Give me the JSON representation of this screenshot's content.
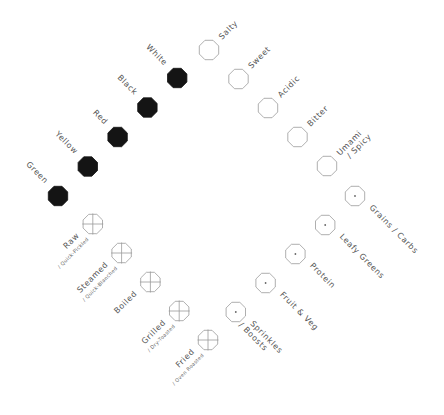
{
  "diagram": {
    "title": "",
    "groups": [
      {
        "name": "tastes",
        "marker": "hollow-octagon",
        "items": [
          {
            "label": "Salty",
            "sub": ""
          },
          {
            "label": "Sweet",
            "sub": ""
          },
          {
            "label": "Acidic",
            "sub": ""
          },
          {
            "label": "Bitter",
            "sub": ""
          },
          {
            "label": "Umami",
            "sub": "/ Spicy"
          }
        ]
      },
      {
        "name": "food-groups",
        "marker": "dotted-octagon",
        "items": [
          {
            "label": "Grains / Carbs",
            "sub": ""
          },
          {
            "label": "Leafy Greens",
            "sub": ""
          },
          {
            "label": "Protein",
            "sub": ""
          },
          {
            "label": "Fruit & Veg",
            "sub": ""
          },
          {
            "label": "Sprinkles",
            "sub": "/ Boosts"
          }
        ]
      },
      {
        "name": "cooking-methods",
        "marker": "crosshair-octagon",
        "items": [
          {
            "label": "Fried",
            "sub": "/ Oven Roasted"
          },
          {
            "label": "Grilled",
            "sub": "/ Dry-Toasted"
          },
          {
            "label": "Boiled",
            "sub": ""
          },
          {
            "label": "Steamed",
            "sub": "/ Quick-Blanched"
          },
          {
            "label": "Raw",
            "sub": "/ Quick-Pickled"
          }
        ]
      },
      {
        "name": "colors",
        "marker": "filled-octagon",
        "items": [
          {
            "label": "Green",
            "sub": ""
          },
          {
            "label": "Yellow",
            "sub": ""
          },
          {
            "label": "Red",
            "sub": ""
          },
          {
            "label": "Black",
            "sub": ""
          },
          {
            "label": "White",
            "sub": ""
          }
        ]
      }
    ],
    "colors": {
      "filled": "#141414",
      "outline": "#9a9a9a",
      "text": "#555555"
    }
  }
}
